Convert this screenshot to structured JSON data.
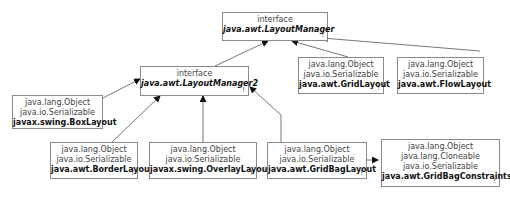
{
  "diagram": {
    "type": "class-hierarchy",
    "nodes": {
      "layoutManager": {
        "kind": "interface",
        "label_kind": "interface",
        "name": "java.awt.LayoutManager",
        "mark": "!"
      },
      "layoutManager2": {
        "kind": "interface",
        "label_kind": "interface",
        "name": "java.awt.LayoutManager2",
        "mark": "!"
      },
      "gridLayout": {
        "supers": [
          "java.lang.Object",
          "java.io.Serializable"
        ],
        "name": "java.awt.GridLayout",
        "mark": "!"
      },
      "flowLayout": {
        "supers": [
          "java.lang.Object",
          "java.io.Serializable"
        ],
        "name": "java.awt.FlowLayout",
        "mark": "!"
      },
      "boxLayout": {
        "supers": [
          "java.lang.Object",
          "java.io.Serializable"
        ],
        "name": "javax.swing.BoxLayout",
        "mark": ""
      },
      "borderLayout": {
        "supers": [
          "java.lang.Object",
          "java.io.Serializable"
        ],
        "name": "java.awt.BorderLayout",
        "mark": "!"
      },
      "overlayLayout": {
        "supers": [
          "java.lang.Object",
          "java.io.Serializable"
        ],
        "name": "javax.swing.OverlayLayout",
        "mark": "!"
      },
      "gridBagLayout": {
        "supers": [
          "java.lang.Object",
          "java.io.Serializable"
        ],
        "name": "java.awt.GridBagLayout",
        "mark": "!"
      },
      "gridBagConstraints": {
        "supers": [
          "java.lang.Object",
          "java.lang.Cloneable",
          "java.io.Serializable"
        ],
        "name": "java.awt.GridBagConstraints",
        "mark": "!"
      }
    },
    "edges": [
      {
        "from": "layoutManager2",
        "to": "layoutManager",
        "type": "extends"
      },
      {
        "from": "gridLayout",
        "to": "layoutManager",
        "type": "implements"
      },
      {
        "from": "flowLayout",
        "to": "layoutManager",
        "type": "implements"
      },
      {
        "from": "boxLayout",
        "to": "layoutManager2",
        "type": "implements"
      },
      {
        "from": "borderLayout",
        "to": "layoutManager2",
        "type": "implements"
      },
      {
        "from": "overlayLayout",
        "to": "layoutManager2",
        "type": "implements"
      },
      {
        "from": "gridBagLayout",
        "to": "layoutManager2",
        "type": "implements"
      },
      {
        "from": "gridBagLayout",
        "to": "gridBagConstraints",
        "type": "uses"
      }
    ]
  }
}
